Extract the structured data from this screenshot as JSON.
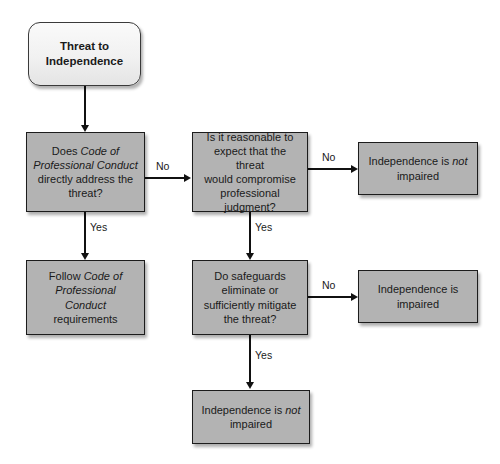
{
  "diagram": {
    "colors": {
      "box_fill": "#b3b3b3",
      "box_stroke": "#1c1c1c",
      "terminator_fill": "#f1f1f1",
      "terminator_stroke": "#3a3a3a",
      "connector": "#111111",
      "text": "#1a1a1a",
      "background": "#ffffff"
    },
    "nodes": {
      "start": {
        "label": "Threat to\nIndependence",
        "shape": "rounded-terminator"
      },
      "code_addresses": {
        "label_part1": "Does ",
        "label_italic1": "Code of\nProfessional Conduct",
        "label_part2": "\ndirectly address the\nthreat?",
        "plain": "Does Code of Professional Conduct directly address the threat?",
        "shape": "process"
      },
      "reasonable_expect": {
        "label": "Is it reasonable to\nexpect that the threat\nwould compromise\nprofessional\njudgment?",
        "shape": "process"
      },
      "not_impaired_top": {
        "label_part1": "Independence is ",
        "label_italic": "not",
        "label_part2": "\nimpaired",
        "plain": "Independence is not impaired",
        "shape": "process"
      },
      "follow_code": {
        "label_part1": "Follow ",
        "label_italic": "Code of\nProfessional\nConduct",
        "label_part2": "\nrequirements",
        "plain": "Follow Code of Professional Conduct requirements",
        "shape": "process"
      },
      "safeguards": {
        "label": "Do safeguards\neliminate or\nsufficiently mitigate\nthe threat?",
        "shape": "process"
      },
      "impaired": {
        "label": "Independence is\nimpaired",
        "shape": "process"
      },
      "not_impaired_bottom": {
        "label_part1": "Independence is ",
        "label_italic": "not",
        "label_part2": "\nimpaired",
        "plain": "Independence is not impaired",
        "shape": "process"
      }
    },
    "edge_labels": {
      "no_1": "No",
      "yes_1": "Yes",
      "no_2": "No",
      "yes_2": "Yes",
      "no_3": "No",
      "yes_3": "Yes"
    }
  }
}
